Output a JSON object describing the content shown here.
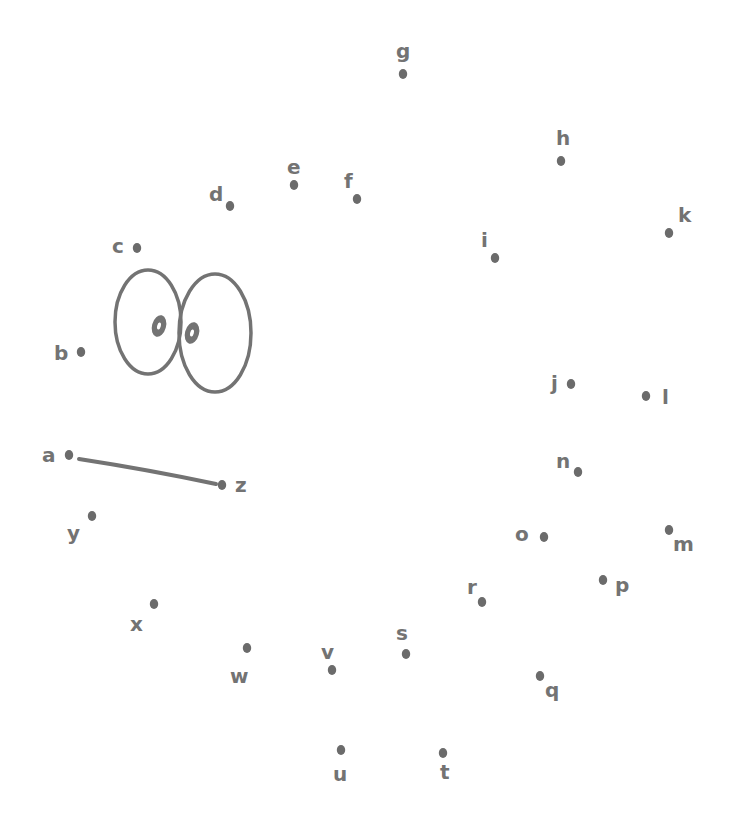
{
  "worksheet": {
    "type": "connect-the-dots",
    "ink_color": "#737373",
    "background": "#ffffff",
    "dots": [
      {
        "label": "a",
        "x": 69,
        "y": 455,
        "lx": 42,
        "ly": 462
      },
      {
        "label": "b",
        "x": 81,
        "y": 352,
        "lx": 54,
        "ly": 360
      },
      {
        "label": "c",
        "x": 137,
        "y": 248,
        "lx": 112,
        "ly": 253
      },
      {
        "label": "d",
        "x": 230,
        "y": 206,
        "lx": 209,
        "ly": 201
      },
      {
        "label": "e",
        "x": 294,
        "y": 185,
        "lx": 287,
        "ly": 174
      },
      {
        "label": "f",
        "x": 357,
        "y": 199,
        "lx": 344,
        "ly": 188
      },
      {
        "label": "g",
        "x": 403,
        "y": 74,
        "lx": 396,
        "ly": 58
      },
      {
        "label": "h",
        "x": 561,
        "y": 161,
        "lx": 556,
        "ly": 145
      },
      {
        "label": "i",
        "x": 495,
        "y": 258,
        "lx": 481,
        "ly": 247
      },
      {
        "label": "j",
        "x": 571,
        "y": 384,
        "lx": 551,
        "ly": 390
      },
      {
        "label": "k",
        "x": 669,
        "y": 233,
        "lx": 678,
        "ly": 222
      },
      {
        "label": "l",
        "x": 646,
        "y": 396,
        "lx": 662,
        "ly": 404
      },
      {
        "label": "m",
        "x": 669,
        "y": 530,
        "lx": 673,
        "ly": 551
      },
      {
        "label": "n",
        "x": 578,
        "y": 472,
        "lx": 556,
        "ly": 468
      },
      {
        "label": "o",
        "x": 544,
        "y": 537,
        "lx": 515,
        "ly": 541
      },
      {
        "label": "p",
        "x": 603,
        "y": 580,
        "lx": 615,
        "ly": 592
      },
      {
        "label": "q",
        "x": 540,
        "y": 676,
        "lx": 545,
        "ly": 697
      },
      {
        "label": "r",
        "x": 482,
        "y": 602,
        "lx": 467,
        "ly": 594
      },
      {
        "label": "s",
        "x": 406,
        "y": 654,
        "lx": 396,
        "ly": 640
      },
      {
        "label": "t",
        "x": 443,
        "y": 753,
        "lx": 440,
        "ly": 779
      },
      {
        "label": "u",
        "x": 341,
        "y": 750,
        "lx": 333,
        "ly": 781
      },
      {
        "label": "v",
        "x": 332,
        "y": 670,
        "lx": 321,
        "ly": 659
      },
      {
        "label": "w",
        "x": 247,
        "y": 648,
        "lx": 230,
        "ly": 683
      },
      {
        "label": "x",
        "x": 154,
        "y": 604,
        "lx": 130,
        "ly": 631
      },
      {
        "label": "y",
        "x": 92,
        "y": 516,
        "lx": 67,
        "ly": 540
      },
      {
        "label": "z",
        "x": 222,
        "y": 485,
        "lx": 235,
        "ly": 492
      }
    ],
    "connected_segment": {
      "from": "a",
      "to": "z"
    },
    "eyes": {
      "left": {
        "cx": 148,
        "cy": 322,
        "rx": 33,
        "ry": 52,
        "pupil_cx": 159,
        "pupil_cy": 326
      },
      "right": {
        "cx": 215,
        "cy": 333,
        "rx": 36,
        "ry": 59,
        "pupil_cx": 192,
        "pupil_cy": 333
      }
    }
  }
}
